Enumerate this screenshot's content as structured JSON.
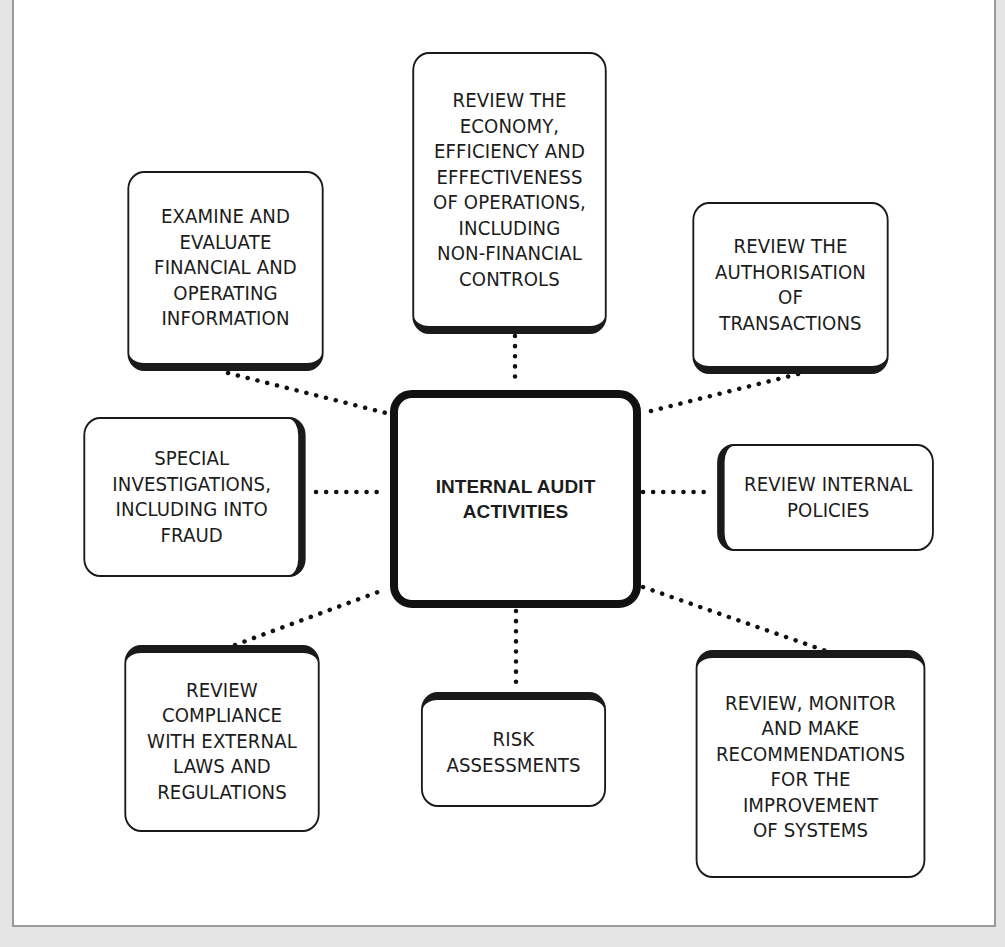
{
  "diagram": {
    "type": "hub-and-spoke",
    "center": {
      "label": "INTERNAL AUDIT\nACTIVITIES"
    },
    "nodes": [
      {
        "id": "top-left",
        "label": "EXAMINE AND\nEVALUATE\nFINANCIAL AND\nOPERATING\nINFORMATION"
      },
      {
        "id": "top",
        "label": "REVIEW THE\nECONOMY,\nEFFICIENCY AND\nEFFECTIVENESS\nOF OPERATIONS,\nINCLUDING\nNON-FINANCIAL\nCONTROLS"
      },
      {
        "id": "top-right",
        "label": "REVIEW THE\nAUTHORISATION\nOF\nTRANSACTIONS"
      },
      {
        "id": "left",
        "label": "SPECIAL\nINVESTIGATIONS,\nINCLUDING INTO\nFRAUD"
      },
      {
        "id": "right",
        "label": "REVIEW INTERNAL\nPOLICIES"
      },
      {
        "id": "bottom-left",
        "label": "REVIEW\nCOMPLIANCE\nWITH EXTERNAL\nLAWS AND\nREGULATIONS"
      },
      {
        "id": "bottom",
        "label": "RISK\nASSESSMENTS"
      },
      {
        "id": "bottom-right",
        "label": "REVIEW, MONITOR\nAND MAKE\nRECOMMENDATIONS\nFOR THE\nIMPROVEMENT\nOF SYSTEMS"
      }
    ],
    "connector_style": "dotted",
    "colors": {
      "stroke": "#111111",
      "background": "#ffffff",
      "frame": "#9a9a9a",
      "outer": "#e4e4e4"
    }
  }
}
